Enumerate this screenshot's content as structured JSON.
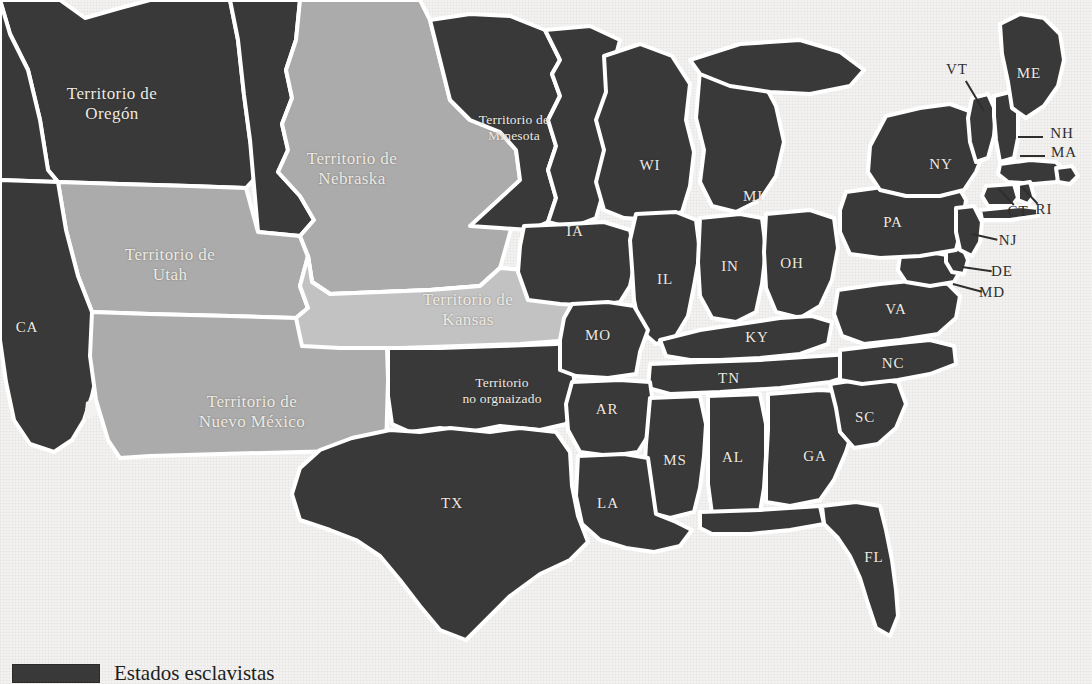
{
  "map": {
    "title": "Mapa de los Estados Unidos, estados y territorios",
    "colors": {
      "state_fill": "#393939",
      "territory_fill": "#ababab",
      "territory_light_fill": "#c2c2c2",
      "background": "#f3f2f0",
      "border": "#ffffff",
      "label_light": "#efeae2",
      "label_dark": "#2e2e2e"
    },
    "territories": [
      {
        "name": "Territorio de\nOregón",
        "x": 112,
        "y": 104,
        "shade": "dark"
      },
      {
        "name": "Territorio de\nNebraska",
        "x": 352,
        "y": 169,
        "shade": "light"
      },
      {
        "name": "Territorio de\nMinesota",
        "x": 514,
        "y": 128,
        "shade": "dark"
      },
      {
        "name": "Territorio de\nUtah",
        "x": 170,
        "y": 265,
        "shade": "light"
      },
      {
        "name": "Territorio de\nKansas",
        "x": 468,
        "y": 310,
        "shade": "light2"
      },
      {
        "name": "Territorio de\nNuevo México",
        "x": 252,
        "y": 412,
        "shade": "light"
      },
      {
        "name": "Territorio\nno orgnaizado",
        "x": 502,
        "y": 391,
        "shade": "dark",
        "small": true
      }
    ],
    "states": [
      {
        "abbr": "CA",
        "x": 27,
        "y": 328
      },
      {
        "abbr": "WI",
        "x": 650,
        "y": 166
      },
      {
        "abbr": "MI",
        "x": 753,
        "y": 197
      },
      {
        "abbr": "IA",
        "x": 575,
        "y": 232
      },
      {
        "abbr": "IL",
        "x": 665,
        "y": 280
      },
      {
        "abbr": "IN",
        "x": 730,
        "y": 267
      },
      {
        "abbr": "OH",
        "x": 792,
        "y": 264
      },
      {
        "abbr": "MO",
        "x": 598,
        "y": 336
      },
      {
        "abbr": "KY",
        "x": 757,
        "y": 338
      },
      {
        "abbr": "TN",
        "x": 729,
        "y": 379
      },
      {
        "abbr": "AR",
        "x": 607,
        "y": 410
      },
      {
        "abbr": "MS",
        "x": 675,
        "y": 461
      },
      {
        "abbr": "AL",
        "x": 733,
        "y": 458
      },
      {
        "abbr": "GA",
        "x": 815,
        "y": 457
      },
      {
        "abbr": "LA",
        "x": 608,
        "y": 504
      },
      {
        "abbr": "TX",
        "x": 452,
        "y": 504
      },
      {
        "abbr": "FL",
        "x": 874,
        "y": 558
      },
      {
        "abbr": "SC",
        "x": 865,
        "y": 418
      },
      {
        "abbr": "NC",
        "x": 893,
        "y": 364
      },
      {
        "abbr": "VA",
        "x": 896,
        "y": 310
      },
      {
        "abbr": "PA",
        "x": 893,
        "y": 223
      },
      {
        "abbr": "NY",
        "x": 941,
        "y": 165
      },
      {
        "abbr": "ME",
        "x": 1029,
        "y": 74
      }
    ],
    "callouts": [
      {
        "abbr": "VT",
        "x": 957,
        "y": 70,
        "line": {
          "x1": 966,
          "y1": 80,
          "x2": 984,
          "y2": 110
        }
      },
      {
        "abbr": "NH",
        "x": 1060,
        "y": 134,
        "line": {
          "x1": 1043,
          "y1": 136,
          "x2": 1018,
          "y2": 136
        }
      },
      {
        "abbr": "MA",
        "x": 1062,
        "y": 153,
        "line": {
          "x1": 1045,
          "y1": 155,
          "x2": 1020,
          "y2": 155
        }
      },
      {
        "abbr": "RI",
        "x": 1043,
        "y": 210,
        "line": {
          "x1": 1038,
          "y1": 203,
          "x2": 1022,
          "y2": 186
        }
      },
      {
        "abbr": "CT",
        "x": 1018,
        "y": 212,
        "line": {
          "x1": 1014,
          "y1": 204,
          "x2": 999,
          "y2": 188
        }
      },
      {
        "abbr": "NJ",
        "x": 1007,
        "y": 241,
        "line": {
          "x1": 997,
          "y1": 239,
          "x2": 972,
          "y2": 233
        }
      },
      {
        "abbr": "DE",
        "x": 1001,
        "y": 272,
        "line": {
          "x1": 991,
          "y1": 270,
          "x2": 962,
          "y2": 266
        }
      },
      {
        "abbr": "MD",
        "x": 992,
        "y": 293,
        "line": {
          "x1": 982,
          "y1": 291,
          "x2": 953,
          "y2": 283
        }
      }
    ],
    "legend": {
      "swatch_color": "#393939",
      "text": "Estados esclavistas"
    }
  }
}
